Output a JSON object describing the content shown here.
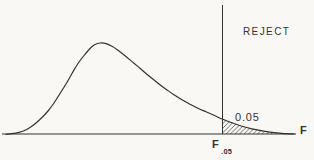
{
  "figure": {
    "paper_color": "#f9f8f5",
    "ink_color": "#333333",
    "labels": {
      "rejection_region": "REJECT",
      "tail_area": "0.05",
      "x_axis": "F",
      "critical_value_base": "F",
      "critical_value_subscript": ".05"
    }
  },
  "chart_data": {
    "type": "area",
    "xlabel": "F",
    "ylabel": "",
    "grid": false,
    "legend": false,
    "tail_area": 0.05,
    "tail_area_label": "0.05",
    "critical_value_label": "F.05",
    "rejection_region_label": "REJECT",
    "curve_points_px": [
      [
        6,
        134.3
      ],
      [
        12,
        133.6
      ],
      [
        18,
        132.6
      ],
      [
        24,
        130.8
      ],
      [
        30,
        127.5
      ],
      [
        36,
        123
      ],
      [
        42,
        117.5
      ],
      [
        48,
        111
      ],
      [
        54,
        103
      ],
      [
        60,
        93.5
      ],
      [
        66,
        84
      ],
      [
        72,
        73.5
      ],
      [
        78,
        63.5
      ],
      [
        84,
        55.5
      ],
      [
        90,
        48.5
      ],
      [
        95,
        44.5
      ],
      [
        100,
        43
      ],
      [
        106,
        43.6
      ],
      [
        112,
        46.2
      ],
      [
        118,
        50.2
      ],
      [
        126,
        56.5
      ],
      [
        134,
        63.2
      ],
      [
        142,
        70
      ],
      [
        150,
        76.8
      ],
      [
        158,
        83.2
      ],
      [
        166,
        89.2
      ],
      [
        174,
        94.8
      ],
      [
        182,
        99.8
      ],
      [
        190,
        104.2
      ],
      [
        198,
        108.2
      ],
      [
        206,
        111.8
      ],
      [
        214,
        115.2
      ],
      [
        222,
        119
      ],
      [
        232,
        122.8
      ],
      [
        242,
        126.2
      ],
      [
        252,
        128.8
      ],
      [
        262,
        130.8
      ],
      [
        272,
        132.3
      ],
      [
        282,
        133.3
      ],
      [
        294,
        134
      ]
    ],
    "axis_px": {
      "x1": 2,
      "y": 134,
      "x2": 296
    },
    "critical_line_px": {
      "x": 222.5,
      "y1": 5,
      "y2": 134
    },
    "shade_from_x_px": 222
  }
}
